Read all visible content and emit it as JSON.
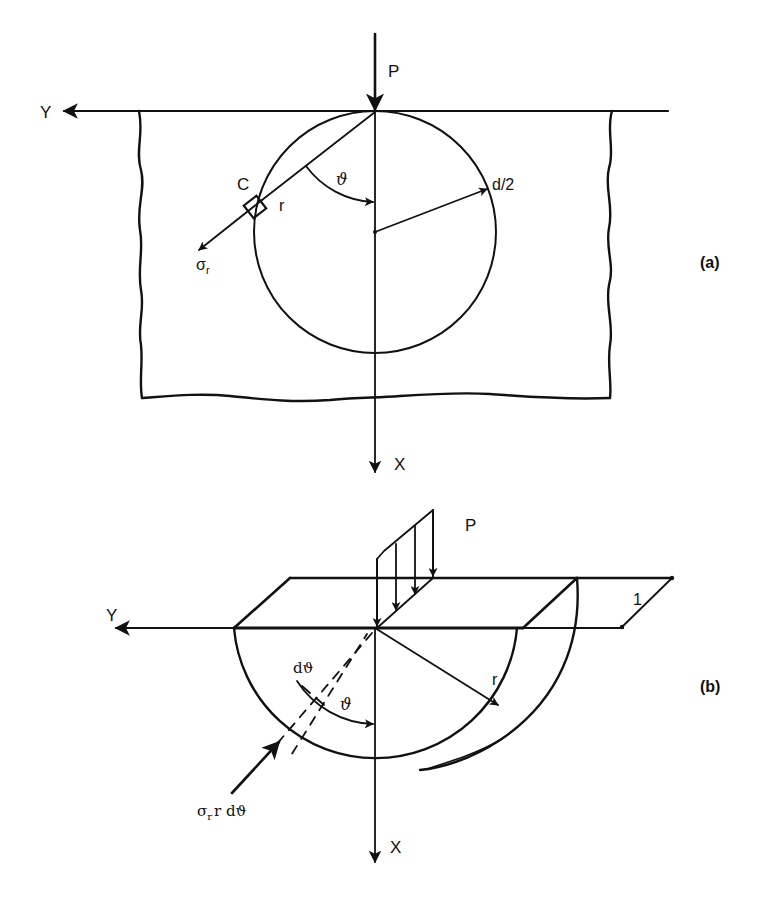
{
  "figure": {
    "colors": {
      "ink": "#111111",
      "background": "#ffffff"
    },
    "panel_a": {
      "caption": "(a)",
      "labels": {
        "load": "P",
        "y_axis": "Y",
        "x_axis": "X",
        "element": "C",
        "radius": "r",
        "angle": "ϑ",
        "diameter_half": "d/2",
        "stress": "σ",
        "stress_sub": "r"
      }
    },
    "panel_b": {
      "caption": "(b)",
      "labels": {
        "load": "P",
        "y_axis": "Y",
        "x_axis": "X",
        "unit_thickness": "1",
        "radius": "r",
        "angle": "ϑ",
        "angle_increment": "dϑ",
        "force_main": "σ",
        "force_sub": "r",
        "force_tail": "r dϑ"
      }
    }
  }
}
